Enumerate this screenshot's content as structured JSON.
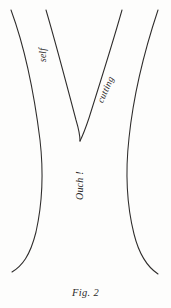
{
  "figure": {
    "caption": "Fig. 2",
    "background_color": "#fdfdfc",
    "ink_color": "#2e2c2b",
    "labels": {
      "left_branch": "self",
      "right_branch": "cutting",
      "trunk": "Ouch !"
    },
    "curves": [
      {
        "name": "outer-left-stroke",
        "path": "M 11 10 C 25 48 34 92 40 140 C 44 175 42 205 36 232 C 30 256 22 266 12 272"
      },
      {
        "name": "inner-left-stroke",
        "path": "M 46 10 C 56 44 66 82 76 120 C 79 130 80 136 80 141"
      },
      {
        "name": "inner-right-stroke",
        "path": "M 122 10 C 113 42 101 80 89 118 C 85 130 82 137 80 141"
      },
      {
        "name": "outer-right-stroke",
        "path": "M 158 10 C 146 46 134 90 129 138 C 125 174 127 206 134 234 C 140 258 149 268 158 274"
      }
    ]
  }
}
